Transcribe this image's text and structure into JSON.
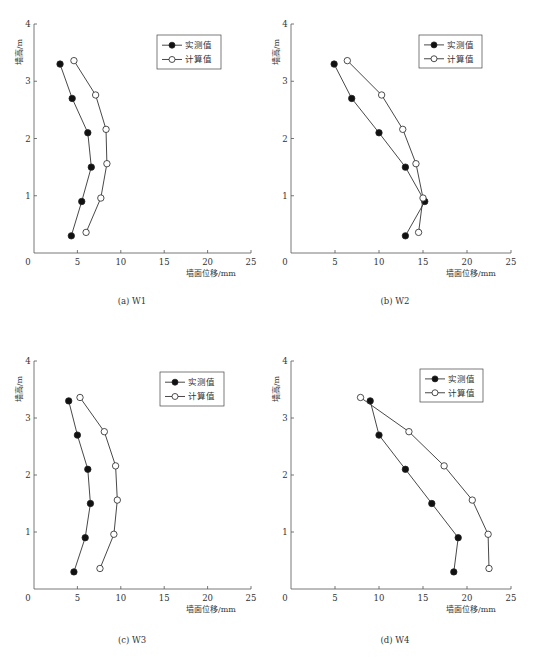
{
  "figure": {
    "legend": {
      "measured_label": "实测值",
      "calculated_label": "计算值"
    },
    "xlabel": "墙面位移/mm",
    "ylabel": "墙高/m"
  },
  "chart_data": [
    {
      "type": "line",
      "title": "(a) W1",
      "caption": "(a) W1",
      "xlabel": "墙面位移/mm",
      "ylabel": "墙高/m",
      "xlim": [
        0,
        25
      ],
      "ylim": [
        0,
        4
      ],
      "xticks": [
        0,
        5,
        10,
        15,
        20,
        25
      ],
      "yticks": [
        1,
        2,
        3,
        4
      ],
      "grid": false,
      "legend_position": "upper right",
      "series": [
        {
          "name": "实测值",
          "marker": "filled-circle",
          "points": [
            [
              4.3,
              0.3
            ],
            [
              5.5,
              0.9
            ],
            [
              6.6,
              1.5
            ],
            [
              6.2,
              2.1
            ],
            [
              4.4,
              2.7
            ],
            [
              3.0,
              3.3
            ]
          ]
        },
        {
          "name": "计算值",
          "marker": "open-circle",
          "points": [
            [
              6.0,
              0.36
            ],
            [
              7.7,
              0.96
            ],
            [
              8.4,
              1.56
            ],
            [
              8.3,
              2.16
            ],
            [
              7.1,
              2.76
            ],
            [
              4.6,
              3.36
            ]
          ]
        }
      ]
    },
    {
      "type": "line",
      "title": "(b) W2",
      "caption": "(b) W2",
      "xlabel": "墙面位移/mm",
      "ylabel": "墙高/m",
      "xlim": [
        0,
        25
      ],
      "ylim": [
        0,
        4
      ],
      "xticks": [
        0,
        5,
        10,
        15,
        20,
        25
      ],
      "yticks": [
        1,
        2,
        3,
        4
      ],
      "grid": false,
      "legend_position": "upper right",
      "series": [
        {
          "name": "实测值",
          "marker": "filled-circle",
          "points": [
            [
              13.0,
              0.3
            ],
            [
              15.2,
              0.9
            ],
            [
              13.0,
              1.5
            ],
            [
              10.0,
              2.1
            ],
            [
              6.9,
              2.7
            ],
            [
              4.9,
              3.3
            ]
          ]
        },
        {
          "name": "计算值",
          "marker": "open-circle",
          "points": [
            [
              14.5,
              0.36
            ],
            [
              15.0,
              0.96
            ],
            [
              14.2,
              1.56
            ],
            [
              12.7,
              2.16
            ],
            [
              10.3,
              2.76
            ],
            [
              6.4,
              3.36
            ]
          ]
        }
      ]
    },
    {
      "type": "line",
      "title": "(c) W3",
      "caption": "(c) W3",
      "xlabel": "墙面位移/mm",
      "ylabel": "墙高/m",
      "xlim": [
        0,
        25
      ],
      "ylim": [
        0,
        4
      ],
      "xticks": [
        0,
        5,
        10,
        15,
        20,
        25
      ],
      "yticks": [
        1,
        2,
        3,
        4
      ],
      "grid": false,
      "legend_position": "upper right",
      "series": [
        {
          "name": "实测值",
          "marker": "filled-circle",
          "points": [
            [
              4.6,
              0.3
            ],
            [
              5.9,
              0.9
            ],
            [
              6.5,
              1.5
            ],
            [
              6.2,
              2.1
            ],
            [
              5.0,
              2.7
            ],
            [
              4.0,
              3.3
            ]
          ]
        },
        {
          "name": "计算值",
          "marker": "open-circle",
          "points": [
            [
              7.6,
              0.36
            ],
            [
              9.2,
              0.96
            ],
            [
              9.6,
              1.56
            ],
            [
              9.4,
              2.16
            ],
            [
              8.1,
              2.76
            ],
            [
              5.3,
              3.36
            ]
          ]
        }
      ]
    },
    {
      "type": "line",
      "title": "(d) W4",
      "caption": "(d) W4",
      "xlabel": "墙面位移/mm",
      "ylabel": "墙高/m",
      "xlim": [
        0,
        25
      ],
      "ylim": [
        0,
        4
      ],
      "xticks": [
        0,
        5,
        10,
        15,
        20,
        25
      ],
      "yticks": [
        1,
        2,
        3,
        4
      ],
      "grid": false,
      "legend_position": "upper right",
      "series": [
        {
          "name": "实测值",
          "marker": "filled-circle",
          "points": [
            [
              18.5,
              0.3
            ],
            [
              19.0,
              0.9
            ],
            [
              16.0,
              1.5
            ],
            [
              13.0,
              2.1
            ],
            [
              10.0,
              2.7
            ],
            [
              9.0,
              3.3
            ]
          ]
        },
        {
          "name": "计算值",
          "marker": "open-circle",
          "points": [
            [
              22.5,
              0.36
            ],
            [
              22.4,
              0.96
            ],
            [
              20.6,
              1.56
            ],
            [
              17.4,
              2.16
            ],
            [
              13.4,
              2.76
            ],
            [
              7.9,
              3.36
            ]
          ]
        }
      ]
    }
  ],
  "layout": {
    "panels": [
      {
        "x0": 34,
        "x1": 251,
        "y0": 253,
        "y1": 24,
        "legend": [
          157,
          35,
          64,
          34
        ],
        "caption_x": 132,
        "caption_y": 304
      },
      {
        "x0": 291,
        "x1": 511,
        "y0": 253,
        "y1": 24,
        "legend": [
          419,
          35,
          63,
          33
        ],
        "caption_x": 395,
        "caption_y": 304
      },
      {
        "x0": 34,
        "x1": 251,
        "y0": 589,
        "y1": 361,
        "legend": [
          160,
          372,
          64,
          34
        ],
        "caption_x": 132,
        "caption_y": 643
      },
      {
        "x0": 291,
        "x1": 511,
        "y0": 589,
        "y1": 361,
        "legend": [
          420,
          369,
          63,
          33
        ],
        "caption_x": 395,
        "caption_y": 643
      }
    ],
    "line_color": "#333333",
    "axis_color": "#555555"
  }
}
